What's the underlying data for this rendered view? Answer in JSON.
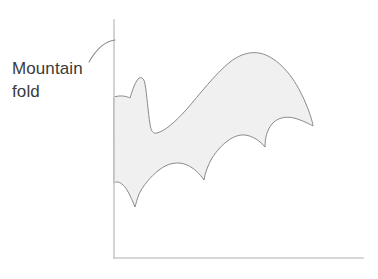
{
  "figure": {
    "type": "origami-fold-diagram",
    "background_color": "#ffffff"
  },
  "annotation": {
    "label_line_1": "Mountain",
    "label_line_2": "fold",
    "label_text": "Mountain\nfold",
    "text_color": "#3a3a3a",
    "leader_icon": "curved-leader-line-icon",
    "leader_color": "#8c8c8c",
    "points_to": "vertical-axis"
  },
  "axes": {
    "vertical_axis_label": "vertical axis line",
    "horizontal_axis_label": "horizontal axis line",
    "color": "#c9c9c9",
    "origin_x": 114,
    "origin_y": 258,
    "vertical_top_y": 20,
    "horizontal_right_x": 363
  },
  "shape": {
    "name": "bat-silhouette",
    "fill_color": "#f0f0f0",
    "stroke_color": "#8a8a8a",
    "stroke_width": 1,
    "description": "Bat wing silhouette folded along the vertical mountain fold axis"
  }
}
